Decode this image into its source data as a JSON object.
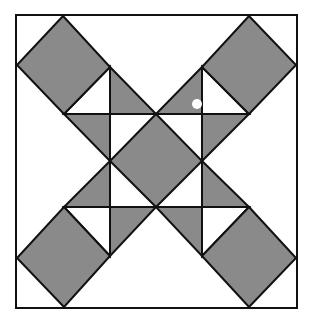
{
  "figure": {
    "title": "",
    "colors": {
      "background": "#ffffff",
      "fill": "#8a8a8a",
      "stroke": "#111111",
      "marker": "#ffffff"
    },
    "border": {
      "x": 16,
      "y": 15,
      "width": 281,
      "height": 293
    },
    "corner_squares": [
      {
        "name": "top-left",
        "points": "63,16 110,67 64,114 17,65"
      },
      {
        "name": "top-right",
        "points": "249,16 296,65 249,114 202,67"
      },
      {
        "name": "bottom-left",
        "points": "64,207 110,256 64,307 17,258"
      },
      {
        "name": "bottom-right",
        "points": "249,207 296,258 249,307 202,256"
      }
    ],
    "center_square": {
      "name": "center",
      "points": "156,114 202,161 156,207 110,161"
    },
    "gray_triangles": [
      {
        "name": "tl-right",
        "points": "110,67 110,114 156,114"
      },
      {
        "name": "tl-below",
        "points": "64,114 110,114 110,161"
      },
      {
        "name": "tr-left",
        "points": "202,67 202,114 156,114"
      },
      {
        "name": "tr-below",
        "points": "249,114 202,114 202,161"
      },
      {
        "name": "bl-above",
        "points": "64,207 110,207 110,161"
      },
      {
        "name": "bl-right",
        "points": "110,256 110,207 156,207"
      },
      {
        "name": "br-above",
        "points": "249,207 202,207 202,161"
      },
      {
        "name": "br-left",
        "points": "202,256 202,207 156,207"
      }
    ],
    "white_triangles": [
      {
        "name": "tl-white",
        "points": "110,67 64,114 110,114"
      },
      {
        "name": "tr-white",
        "points": "202,67 249,114 202,114"
      },
      {
        "name": "bl-white",
        "points": "64,207 110,207 110,256"
      },
      {
        "name": "br-white",
        "points": "249,207 202,207 202,256"
      }
    ],
    "grid_lines": [
      {
        "name": "vertical-left",
        "x1": 110,
        "y1": 67,
        "x2": 110,
        "y2": 256
      },
      {
        "name": "vertical-right",
        "x1": 202,
        "y1": 67,
        "x2": 202,
        "y2": 256
      },
      {
        "name": "horizontal-top",
        "x1": 64,
        "y1": 114,
        "x2": 249,
        "y2": 114
      },
      {
        "name": "horizontal-bottom",
        "x1": 64,
        "y1": 207,
        "x2": 249,
        "y2": 207
      }
    ],
    "marker": {
      "name": "white-dot",
      "cx": 197,
      "cy": 104,
      "r": 5
    }
  }
}
